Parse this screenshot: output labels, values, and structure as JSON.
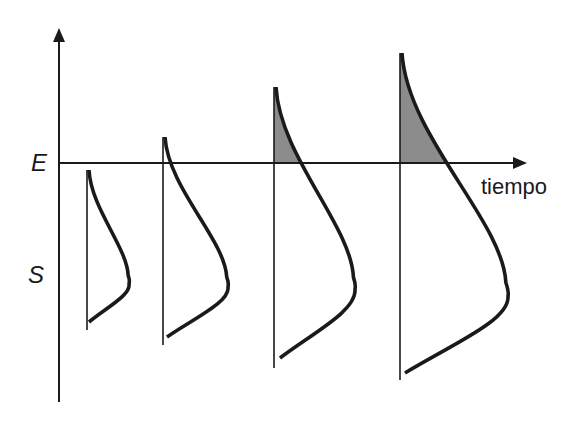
{
  "diagram": {
    "labels": {
      "upper_axis_label": "E",
      "lower_axis_label": "S",
      "time_axis_label": "tiempo"
    },
    "colors": {
      "line": "#1a1a1a",
      "shaded_area": "#8c8c8c",
      "background": "#ffffff"
    },
    "axes": {
      "vertical_axis": {
        "x": 59,
        "y_top": 28,
        "y_bottom": 402
      },
      "time_axis": {
        "y": 163,
        "x_start": 59,
        "x_end": 527
      }
    },
    "pulses": [
      {
        "id": 1,
        "baseline_x": 87,
        "top_y": 170,
        "bottom_y": 330,
        "bulge_x": 129,
        "bulge_y": 280,
        "end_x": 89,
        "end_y": 322,
        "exceeds_threshold": false
      },
      {
        "id": 2,
        "baseline_x": 163,
        "top_y": 137,
        "bottom_y": 345,
        "bulge_x": 228,
        "bulge_y": 283,
        "end_x": 167,
        "end_y": 337,
        "exceeds_threshold": true,
        "shaded": false
      },
      {
        "id": 3,
        "baseline_x": 274,
        "top_y": 87,
        "bottom_y": 368,
        "bulge_x": 355,
        "bulge_y": 285,
        "end_x": 280,
        "end_y": 358,
        "exceeds_threshold": true,
        "shaded": true
      },
      {
        "id": 4,
        "baseline_x": 400,
        "top_y": 53,
        "bottom_y": 380,
        "bulge_x": 508,
        "bulge_y": 292,
        "end_x": 405,
        "end_y": 373,
        "exceeds_threshold": true,
        "shaded": true
      }
    ]
  }
}
